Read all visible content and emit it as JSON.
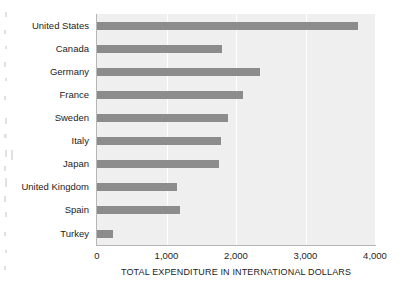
{
  "chart_data": {
    "type": "bar",
    "orientation": "horizontal",
    "title": "",
    "xlabel": "TOTAL EXPENDITURE IN INTERNATIONAL DOLLARS",
    "ylabel": "",
    "categories": [
      "United States",
      "Canada",
      "Germany",
      "France",
      "Sweden",
      "Italy",
      "Japan",
      "United Kingdom",
      "Spain",
      "Turkey"
    ],
    "values": [
      3750,
      1800,
      2340,
      2100,
      1890,
      1790,
      1750,
      1150,
      1190,
      230
    ],
    "xlim": [
      0,
      4000
    ],
    "xticks": [
      0,
      1000,
      2000,
      3000,
      4000
    ],
    "xtick_labels": [
      "0",
      "1,000",
      "2,000",
      "3,000",
      "4,000"
    ],
    "grid": "vertical-white-gridlines",
    "legend": "none",
    "colors": {
      "bar": "#8c8c8c",
      "plot_background": "#efefef",
      "gridline": "#ffffff",
      "axis_line": "#b6b6b6",
      "text": "#1d1d1b",
      "page_background": "#ffffff"
    }
  }
}
